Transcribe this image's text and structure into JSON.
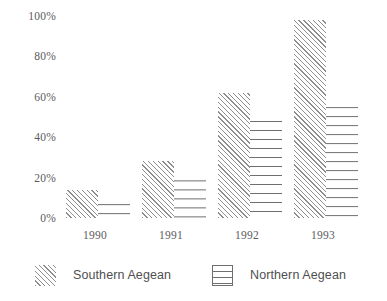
{
  "chart_data": {
    "type": "bar",
    "title": "",
    "subtitle": "",
    "xlabel": "",
    "ylabel": "",
    "categories": [
      "1990",
      "1991",
      "1992",
      "1993"
    ],
    "series": [
      {
        "name": "Southern Aegean",
        "values": [
          14,
          28,
          62,
          98
        ]
      },
      {
        "name": "Northern Aegean",
        "values": [
          7,
          19,
          48,
          55
        ]
      }
    ],
    "ylim": [
      0,
      100
    ],
    "yticks": [
      "0%",
      "20%",
      "40%",
      "60%",
      "80%",
      "100%"
    ],
    "ytick_values": [
      0,
      20,
      40,
      60,
      80,
      100
    ],
    "grid": false,
    "legend_position": "bottom",
    "value_unit": "%"
  },
  "axes": {
    "y_labels": [
      "100%",
      "80%",
      "60%",
      "40%",
      "20%",
      "0%"
    ],
    "x_labels": [
      "1990",
      "1991",
      "1992",
      "1993"
    ]
  },
  "legend": {
    "entries": [
      {
        "label": "Southern Aegean",
        "pattern": "diagonal-hatch"
      },
      {
        "label": "Northern Aegean",
        "pattern": "horizontal-lines"
      }
    ]
  },
  "colors": {
    "background": "#ffffff",
    "text": "#5a5a5c",
    "southern_hatch": "#8e8e90",
    "northern_lines": "#6f6f71"
  }
}
